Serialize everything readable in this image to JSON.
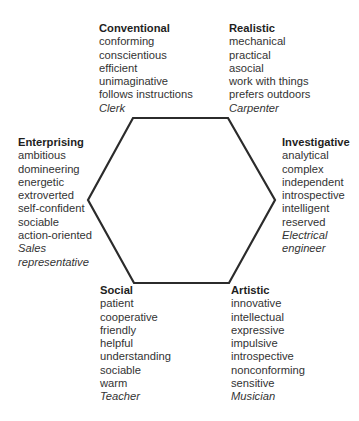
{
  "diagram": {
    "type": "hexagon",
    "line_color": "#2b2b2b",
    "vertices": [
      [
        133,
        118
      ],
      [
        228,
        118
      ],
      [
        275,
        200
      ],
      [
        229,
        283
      ],
      [
        134,
        283
      ],
      [
        88,
        200
      ]
    ]
  },
  "types": [
    {
      "name": "Conventional",
      "traits": [
        "conforming",
        "conscientious",
        "efficient",
        "unimaginative",
        "follows instructions"
      ],
      "occupation": "Clerk"
    },
    {
      "name": "Realistic",
      "traits": [
        "mechanical",
        "practical",
        "asocial",
        "work with things",
        "prefers outdoors"
      ],
      "occupation": "Carpenter"
    },
    {
      "name": "Investigative",
      "traits": [
        "analytical",
        "complex",
        "independent",
        "introspective",
        "intelligent",
        "reserved"
      ],
      "occupation_lines": [
        "Electrical",
        "engineer"
      ]
    },
    {
      "name": "Artistic",
      "traits": [
        "innovative",
        "intellectual",
        "expressive",
        "impulsive",
        "introspective",
        "nonconforming",
        "sensitive"
      ],
      "occupation": "Musician"
    },
    {
      "name": "Social",
      "traits": [
        "patient",
        "cooperative",
        "friendly",
        "helpful",
        "understanding",
        "sociable",
        "warm"
      ],
      "occupation": "Teacher"
    },
    {
      "name": "Enterprising",
      "traits": [
        "ambitious",
        "domineering",
        "energetic",
        "extroverted",
        "self-confident",
        "sociable",
        "action-oriented"
      ],
      "occupation_lines": [
        "Sales",
        "representative"
      ]
    }
  ]
}
